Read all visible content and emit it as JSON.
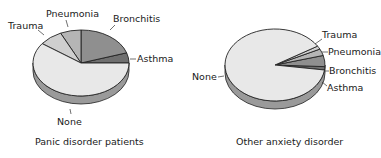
{
  "chart_data": [
    {
      "type": "pie",
      "title": "Panic disorder patients",
      "categories": [
        "None",
        "Trauma",
        "Pneumonia",
        "Bronchitis",
        "Asthma"
      ],
      "values": [
        60,
        8,
        7,
        20,
        5
      ],
      "unit": "percent (estimated)",
      "colors": [
        "#e8e8e8",
        "#cfcfcf",
        "#b5b5b5",
        "#8f8f8f",
        "#6f6f6f"
      ]
    },
    {
      "type": "pie",
      "title": "Other anxiety disorder",
      "categories": [
        "None",
        "Trauma",
        "Pneumonia",
        "Bronchitis",
        "Asthma"
      ],
      "values": [
        89,
        1.5,
        3,
        5,
        1.5
      ],
      "unit": "percent (estimated)",
      "colors": [
        "#e8e8e8",
        "#cfcfcf",
        "#b5b5b5",
        "#8f8f8f",
        "#6f6f6f"
      ]
    }
  ],
  "labels": {
    "left": {
      "none": "None",
      "trauma": "Trauma",
      "pneumonia": "Pneumonia",
      "bronchitis": "Bronchitis",
      "asthma": "Asthma",
      "caption": "Panic disorder patients"
    },
    "right": {
      "none": "None",
      "trauma": "Trauma",
      "pneumonia": "Pneumonia",
      "bronchitis": "Bronchitis",
      "asthma": "Asthma",
      "caption": "Other anxiety disorder"
    }
  }
}
